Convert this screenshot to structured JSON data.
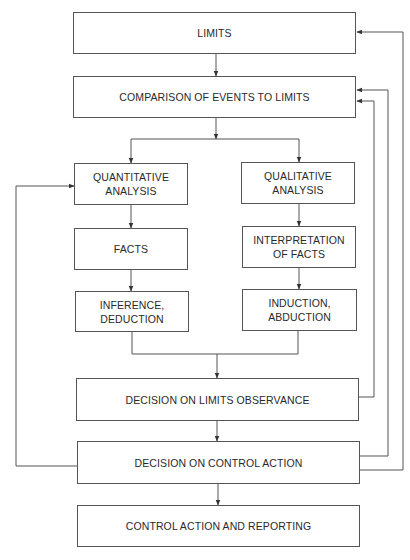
{
  "diagram": {
    "nodes": {
      "limits": {
        "label": "LIMITS"
      },
      "comparison": {
        "label": "COMPARISON OF EVENTS TO LIMITS"
      },
      "quantitative": {
        "label": "QUANTITATIVE\nANALYSIS"
      },
      "qualitative": {
        "label": "QUALITATIVE\nANALYSIS"
      },
      "facts": {
        "label": "FACTS"
      },
      "interpretation": {
        "label": "INTERPRETATION\nOF FACTS"
      },
      "inference": {
        "label": "INFERENCE,\nDEDUCTION"
      },
      "induction": {
        "label": "INDUCTION,\nABDUCTION"
      },
      "decision_limits": {
        "label": "DECISION ON LIMITS OBSERVANCE"
      },
      "decision_control": {
        "label": "DECISION ON CONTROL ACTION"
      },
      "control_action": {
        "label": "CONTROL ACTION AND REPORTING"
      }
    },
    "edges": [
      {
        "from": "LIMITS",
        "to": "COMPARISON OF EVENTS TO LIMITS"
      },
      {
        "from": "COMPARISON OF EVENTS TO LIMITS",
        "to": "QUANTITATIVE ANALYSIS"
      },
      {
        "from": "COMPARISON OF EVENTS TO LIMITS",
        "to": "QUALITATIVE ANALYSIS"
      },
      {
        "from": "QUANTITATIVE ANALYSIS",
        "to": "FACTS"
      },
      {
        "from": "FACTS",
        "to": "INFERENCE, DEDUCTION"
      },
      {
        "from": "QUALITATIVE ANALYSIS",
        "to": "INTERPRETATION OF FACTS"
      },
      {
        "from": "INTERPRETATION OF FACTS",
        "to": "INDUCTION, ABDUCTION"
      },
      {
        "from": "INFERENCE, DEDUCTION",
        "to": "DECISION ON LIMITS OBSERVANCE"
      },
      {
        "from": "INDUCTION, ABDUCTION",
        "to": "DECISION ON LIMITS OBSERVANCE"
      },
      {
        "from": "DECISION ON LIMITS OBSERVANCE",
        "to": "DECISION ON CONTROL ACTION"
      },
      {
        "from": "DECISION ON CONTROL ACTION",
        "to": "CONTROL ACTION AND REPORTING"
      },
      {
        "from": "DECISION ON LIMITS OBSERVANCE",
        "to": "COMPARISON OF EVENTS TO LIMITS",
        "type": "feedback"
      },
      {
        "from": "DECISION ON CONTROL ACTION",
        "to": "COMPARISON OF EVENTS TO LIMITS",
        "type": "feedback"
      },
      {
        "from": "DECISION ON CONTROL ACTION",
        "to": "LIMITS",
        "type": "feedback"
      },
      {
        "from": "DECISION ON CONTROL ACTION",
        "to": "QUANTITATIVE ANALYSIS",
        "type": "feedback"
      }
    ],
    "colors": {
      "line": "#555555",
      "text": "#2a2a2a",
      "background": "#ffffff"
    }
  }
}
